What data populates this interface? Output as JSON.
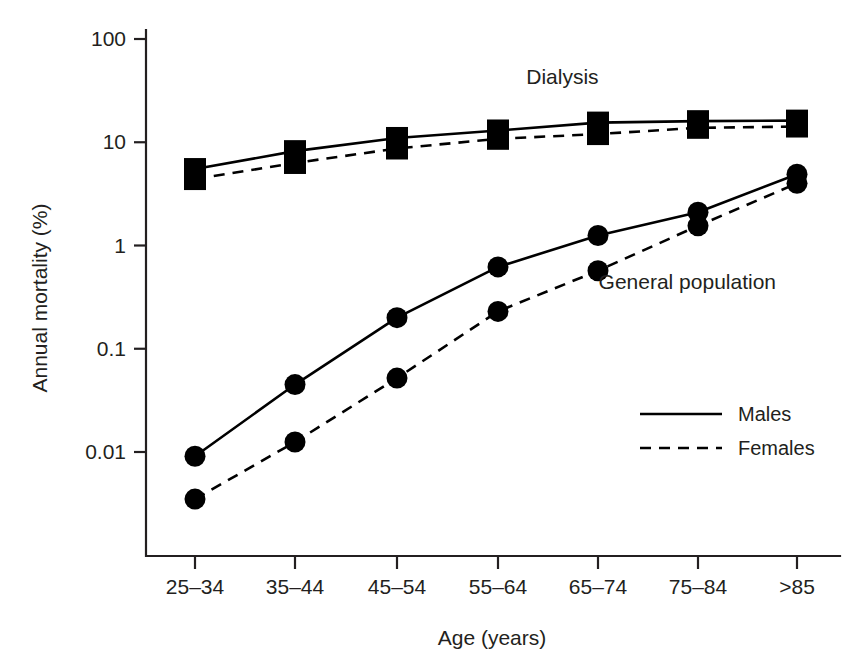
{
  "chart_data": {
    "type": "line",
    "title": "",
    "xlabel": "Age (years)",
    "ylabel": "Annual mortality (%)",
    "categories": [
      "25–34",
      "35–44",
      "45–54",
      "55–64",
      "65–74",
      "75–84",
      ">85"
    ],
    "y_scale": "log",
    "ylim": [
      0.0022,
      100
    ],
    "y_ticks": [
      100,
      10,
      1,
      0.1,
      0.01
    ],
    "y_tick_labels": [
      "100",
      "10",
      "1",
      "0.1",
      "0.01"
    ],
    "grid": false,
    "legend_position": "center-right",
    "legend": [
      {
        "label": "Males",
        "style": "solid"
      },
      {
        "label": "Females",
        "style": "dashed"
      }
    ],
    "annotations": [
      {
        "text": "Dialysis",
        "x_frac": 0.6,
        "y_value": 37
      },
      {
        "text": "General population",
        "x_frac": 0.78,
        "y_value": 0.38
      }
    ],
    "series": [
      {
        "name": "Dialysis Males",
        "group": "Dialysis",
        "sex": "Males",
        "style": "solid",
        "marker": "square",
        "values": [
          5.5,
          8.2,
          11.0,
          13.0,
          15.5,
          16.0,
          16.2
        ]
      },
      {
        "name": "Dialysis Females",
        "group": "Dialysis",
        "sex": "Females",
        "style": "dashed",
        "marker": "square",
        "values": [
          4.4,
          6.3,
          8.7,
          10.8,
          12.0,
          13.8,
          14.2
        ]
      },
      {
        "name": "General population Males",
        "group": "General population",
        "sex": "Males",
        "style": "solid",
        "marker": "circle",
        "values": [
          0.0091,
          0.045,
          0.2,
          0.62,
          1.25,
          2.1,
          4.9
        ]
      },
      {
        "name": "General population Females",
        "group": "General population",
        "sex": "Females",
        "style": "dashed",
        "marker": "circle",
        "values": [
          0.0035,
          0.0125,
          0.052,
          0.23,
          0.57,
          1.55,
          4.0
        ]
      }
    ]
  }
}
